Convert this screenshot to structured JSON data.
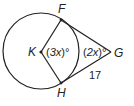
{
  "diagram": {
    "title": "",
    "points": {
      "F": "F",
      "H": "H",
      "K": "K",
      "G": "G"
    },
    "angles": {
      "central_angle_K": {
        "prefix": "(",
        "var": "3x",
        "suffix": ")°"
      },
      "angle_G": {
        "prefix": "(",
        "var": "2x",
        "suffix": ")°"
      }
    },
    "segments": {
      "GH_length": "17"
    },
    "colors": {
      "stroke": "#222222",
      "background": "#ffffff"
    }
  }
}
